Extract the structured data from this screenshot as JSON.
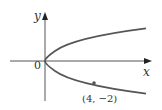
{
  "diagram": {
    "type": "graph",
    "equation": "x = y^2",
    "axes": {
      "x_label": "x",
      "y_label": "y",
      "origin_label": "0"
    },
    "point": {
      "label": "(4, −2)",
      "x": 4,
      "y": -2
    },
    "colors": {
      "curve": "#555555",
      "axes": "#555555",
      "text": "#333333"
    }
  }
}
